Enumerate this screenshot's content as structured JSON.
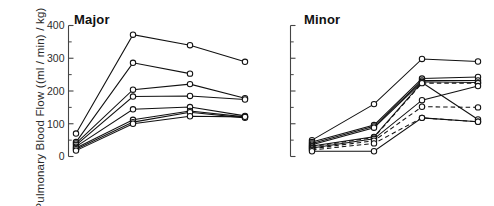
{
  "figure": {
    "ylabel": "Pulmonary Blood Flow ((ml / min) / kg)",
    "axis_color": "#444444",
    "line_color": "#111111",
    "marker_fill": "#ffffff",
    "background": "#ffffff"
  },
  "panels": [
    {
      "key": "major",
      "title": "Major",
      "axis_labeled": true
    },
    {
      "key": "minor",
      "title": "Minor",
      "axis_labeled": false
    }
  ],
  "axis": {
    "ylim": [
      0,
      400
    ],
    "major_ticks": [
      0,
      100,
      200,
      300,
      400
    ],
    "minor_ticks": [
      50,
      150,
      250,
      350
    ],
    "tick_labels": [
      "0",
      "100",
      "200",
      "300",
      "400"
    ]
  },
  "chart_data": [
    {
      "type": "line",
      "title": "Major",
      "xlabel": "",
      "ylabel": "Pulmonary Blood Flow ((ml / min) / kg)",
      "ylim": [
        0,
        400
      ],
      "grid": false,
      "legend": "none",
      "x": [
        1,
        2,
        3,
        4
      ],
      "marker": "open-circle",
      "series": [
        {
          "name": "subject-1",
          "style": "solid",
          "values": [
            70,
            372,
            340,
            289
          ]
        },
        {
          "name": "subject-2",
          "style": "solid",
          "values": [
            44,
            286,
            253,
            null
          ]
        },
        {
          "name": "subject-3",
          "style": "solid",
          "values": [
            40,
            204,
            221,
            178
          ]
        },
        {
          "name": "subject-4",
          "style": "solid",
          "values": [
            35,
            183,
            185,
            174
          ]
        },
        {
          "name": "subject-5",
          "style": "solid",
          "values": [
            30,
            144,
            151,
            124
          ]
        },
        {
          "name": "subject-6",
          "style": "solid",
          "values": [
            26,
            112,
            139,
            121
          ]
        },
        {
          "name": "subject-7",
          "style": "solid",
          "values": [
            22,
            105,
            135,
            118
          ]
        },
        {
          "name": "subject-8",
          "style": "solid",
          "values": [
            18,
            100,
            123,
            121
          ]
        }
      ]
    },
    {
      "type": "line",
      "title": "Minor",
      "xlabel": "",
      "ylabel": "",
      "ylim": [
        0,
        400
      ],
      "grid": false,
      "legend": "none",
      "x": [
        1,
        2,
        3,
        4
      ],
      "marker": "open-circle",
      "series": [
        {
          "name": "subject-1",
          "style": "solid",
          "values": [
            50,
            160,
            298,
            290
          ]
        },
        {
          "name": "subject-2",
          "style": "solid",
          "values": [
            44,
            96,
            238,
            243
          ]
        },
        {
          "name": "subject-3",
          "style": "solid",
          "values": [
            40,
            92,
            232,
            232
          ]
        },
        {
          "name": "subject-4",
          "style": "solid",
          "values": [
            36,
            88,
            228,
            226
          ]
        },
        {
          "name": "subject-5",
          "style": "solid",
          "values": [
            32,
            60,
            226,
            113
          ]
        },
        {
          "name": "subject-6",
          "style": "dashed",
          "values": [
            30,
            58,
            224,
            224
          ]
        },
        {
          "name": "subject-7",
          "style": "solid",
          "values": [
            26,
            54,
            172,
            215
          ]
        },
        {
          "name": "subject-8",
          "style": "dashed",
          "values": [
            24,
            48,
            152,
            150
          ]
        },
        {
          "name": "subject-9",
          "style": "dashed",
          "values": [
            20,
            40,
            118,
            106
          ]
        },
        {
          "name": "subject-10",
          "style": "solid",
          "values": [
            16,
            16,
            118,
            106
          ]
        }
      ]
    }
  ]
}
